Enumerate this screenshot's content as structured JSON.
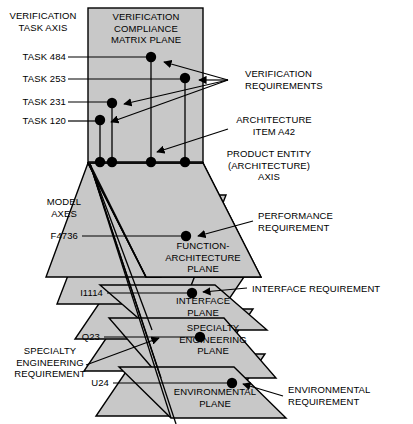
{
  "diagram": {
    "colors": {
      "plane_fill": "#c8c8c8",
      "plane_fill_light": "#d2d2d2",
      "stroke": "#000000",
      "background": "#ffffff",
      "dot": "#000000"
    },
    "axis_labels": {
      "verification_task_axis": "VERIFICATION\nTASK AXIS",
      "product_entity_axis": "PRODUCT ENTITY\n(ARCHITECTURE)\nAXIS",
      "model_axes": "MODEL\nAXES"
    },
    "planes": [
      {
        "id": "matrix",
        "label": "VERIFICATION\nCOMPLIANCE\nMATRIX PLANE"
      },
      {
        "id": "function",
        "label": "FUNCTION-\nARCHITECTURE\nPLANE"
      },
      {
        "id": "interface",
        "label": "INTERFACE\nPLANE"
      },
      {
        "id": "specialty",
        "label": "SPECIALTY\nENGINEERING\nPLANE"
      },
      {
        "id": "environmental",
        "label": "ENVIRONMENTAL\nPLANE"
      }
    ],
    "tasks": [
      {
        "id": "task484",
        "label": "TASK 484"
      },
      {
        "id": "task253",
        "label": "TASK 253"
      },
      {
        "id": "task231",
        "label": "TASK 231"
      },
      {
        "id": "task120",
        "label": "TASK 120"
      }
    ],
    "item_labels": [
      {
        "id": "f4736",
        "label": "F4736"
      },
      {
        "id": "i1114",
        "label": "I1114"
      },
      {
        "id": "q23",
        "label": "Q23"
      },
      {
        "id": "u24",
        "label": "U24"
      }
    ],
    "callouts": [
      {
        "id": "verification-requirements",
        "label": "VERIFICATION\nREQUIREMENTS"
      },
      {
        "id": "architecture-item",
        "label": "ARCHITECTURE\nITEM A42"
      },
      {
        "id": "performance-requirement",
        "label": "PERFORMANCE\nREQUIREMENT"
      },
      {
        "id": "interface-requirement",
        "label": "INTERFACE REQUIREMENT"
      },
      {
        "id": "specialty-eng-requirement",
        "label": "SPECIALTY\nENGINEERING\nREQUIREMENT"
      },
      {
        "id": "environmental-requirement",
        "label": "ENVIRONMENTAL\nREQUIREMENT"
      }
    ]
  }
}
